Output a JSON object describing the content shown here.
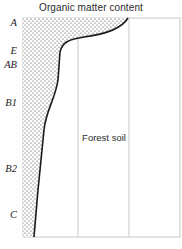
{
  "diagram": {
    "title": "Organic matter content",
    "panel_label": "Forest soil",
    "horizons": [
      {
        "label": "A",
        "y": 24
      },
      {
        "label": "E",
        "y": 52
      },
      {
        "label": "AB",
        "y": 66
      },
      {
        "label": "B1",
        "y": 104
      },
      {
        "label": "B2",
        "y": 170
      },
      {
        "label": "C",
        "y": 216
      }
    ],
    "colors": {
      "curve": "#1a1a1a",
      "grid": "#c8c8c8",
      "stipple": "#3a3a3a",
      "text": "#2a2a2a"
    }
  }
}
